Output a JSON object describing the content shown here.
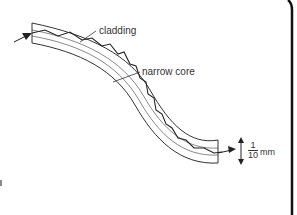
{
  "diagram": {
    "type": "optical-fiber-cross-section",
    "labels": {
      "cladding": "cladding",
      "core": "narrow core"
    },
    "scale": {
      "numerator": "1",
      "denominator": "10",
      "unit": "mm"
    },
    "colors": {
      "line": "#333333",
      "background": "#ffffff",
      "frame": "#111111"
    }
  }
}
